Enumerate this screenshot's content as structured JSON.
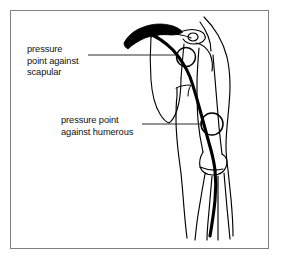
{
  "figure": {
    "frame_color": "#7f7f7f",
    "ink_color": "#000000",
    "background_color": "#ffffff",
    "annotations": [
      {
        "id": "scapular",
        "name": "pressure-point-scapular",
        "lines": [
          "pressure",
          "point against",
          "scapular"
        ],
        "line1": "pressure",
        "line2": "point against",
        "line3": "scapular",
        "leader_from": [
          88,
          55
        ],
        "leader_to": [
          178,
          55
        ],
        "marker_circle": {
          "cx": 186,
          "cy": 57,
          "r": 9.5
        }
      },
      {
        "id": "humerous",
        "name": "pressure-point-humerous",
        "lines": [
          "pressure point",
          "against humerous"
        ],
        "line1": "pressure point",
        "line2": "against humerous",
        "leader_from": [
          142,
          124
        ],
        "leader_to": [
          202,
          124
        ],
        "marker_circle": {
          "cx": 212,
          "cy": 124,
          "r": 11
        }
      }
    ],
    "anatomy_parts": [
      "clavicle",
      "scapula",
      "humerus",
      "ulna",
      "radius",
      "brachial-artery"
    ]
  }
}
